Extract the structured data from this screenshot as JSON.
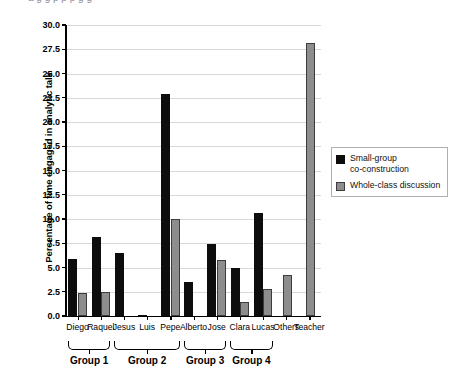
{
  "top_caption": "a g  g  p  p  p  g      g",
  "chart_data": {
    "type": "bar",
    "title": "",
    "xlabel": "",
    "ylabel": "Percentage of time engaged in analytic talk",
    "ylim": [
      0.0,
      30.0
    ],
    "ytick_labels": [
      "0.0",
      "2.5",
      "5.0",
      "7.5",
      "10.0",
      "12.5",
      "15.0",
      "17.5",
      "20.0",
      "22.5",
      "25.0",
      "27.5",
      "30.0"
    ],
    "ytick_values": [
      0.0,
      2.5,
      5.0,
      7.5,
      10.0,
      12.5,
      15.0,
      17.5,
      20.0,
      22.5,
      25.0,
      27.5,
      30.0
    ],
    "grid": true,
    "legend_position": "right",
    "categories": [
      "Diego",
      "Raquel",
      "Jesus",
      "Luis",
      "Pepe",
      "Alberto",
      "Jose",
      "Clara",
      "Lucas",
      "Others",
      "Teacher"
    ],
    "series": [
      {
        "name": "Small-group co-construction",
        "color": "#0d0d0d",
        "values": [
          5.9,
          8.1,
          6.5,
          0.15,
          22.9,
          3.5,
          7.4,
          5.0,
          10.6,
          0,
          0
        ]
      },
      {
        "name": "Whole-class discussion",
        "color": "#8d8d8d",
        "values": [
          2.4,
          2.5,
          0,
          0,
          10.0,
          0,
          5.8,
          1.4,
          2.8,
          4.2,
          28.1
        ]
      }
    ],
    "groups": [
      {
        "label": "Group 1",
        "members": [
          "Diego",
          "Raquel"
        ]
      },
      {
        "label": "Group 2",
        "members": [
          "Jesus",
          "Luis",
          "Pepe"
        ]
      },
      {
        "label": "Group 3",
        "members": [
          "Alberto",
          "Jose"
        ]
      },
      {
        "label": "Group 4",
        "members": [
          "Clara",
          "Lucas"
        ]
      }
    ]
  },
  "legend": {
    "items": [
      {
        "label": "Small-group\nco-construction",
        "swatch": "s0"
      },
      {
        "label": "Whole-class discussion",
        "swatch": "s1"
      }
    ]
  }
}
